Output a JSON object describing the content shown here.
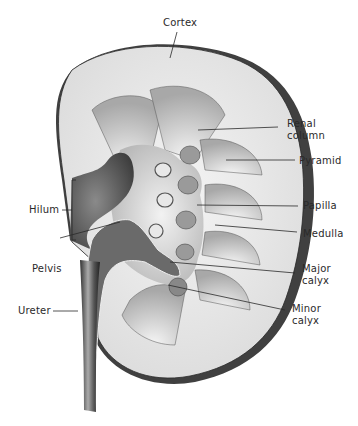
{
  "diagram": {
    "colors": {
      "background": "#ffffff",
      "ink": "#2a2a2a",
      "capsule": "#3a3a3a",
      "cortex": "#e9e9e9",
      "pyramid": "#cfcfcf",
      "sinus": "#d8d8d8",
      "pelvis_dark": "#555555"
    },
    "labels": {
      "cortex": "Cortex",
      "renal_column_1": "Renal",
      "renal_column_2": "column",
      "pyramid": "Pyramid",
      "papilla": "Papilla",
      "medulla": "Medulla",
      "major_calyx_1": "Major",
      "major_calyx_2": "calyx",
      "minor_calyx_1": "Minor",
      "minor_calyx_2": "calyx",
      "hilum": "Hilum",
      "pelvis": "Pelvis",
      "ureter": "Ureter"
    }
  }
}
